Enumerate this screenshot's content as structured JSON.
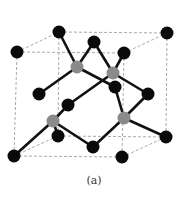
{
  "diagram": {
    "caption": "(a)",
    "colors": {
      "atom": "#0a0a0a",
      "interior_atom": "#8a8a8a",
      "bond": "#111111",
      "cube_edge": "#aaaaaa",
      "background": "#ffffff"
    },
    "atoms": [
      {
        "id": "a1",
        "x": 17,
        "y": 52,
        "type": "corner"
      },
      {
        "id": "a2",
        "x": 59,
        "y": 32,
        "type": "corner"
      },
      {
        "id": "a3",
        "x": 167,
        "y": 33,
        "type": "corner"
      },
      {
        "id": "a4",
        "x": 124,
        "y": 53,
        "type": "face"
      },
      {
        "id": "a5",
        "x": 94,
        "y": 42,
        "type": "face"
      },
      {
        "id": "a6",
        "x": 77,
        "y": 67,
        "type": "interior"
      },
      {
        "id": "a7",
        "x": 113,
        "y": 73,
        "type": "interior"
      },
      {
        "id": "a8",
        "x": 115,
        "y": 87,
        "type": "face"
      },
      {
        "id": "a9",
        "x": 148,
        "y": 94,
        "type": "face"
      },
      {
        "id": "a10",
        "x": 39,
        "y": 94,
        "type": "face"
      },
      {
        "id": "a11",
        "x": 68,
        "y": 105,
        "type": "face"
      },
      {
        "id": "a12",
        "x": 53,
        "y": 121,
        "type": "interior"
      },
      {
        "id": "a13",
        "x": 124,
        "y": 118,
        "type": "interior"
      },
      {
        "id": "a14",
        "x": 58,
        "y": 136,
        "type": "face"
      },
      {
        "id": "a15",
        "x": 166,
        "y": 137,
        "type": "corner"
      },
      {
        "id": "a16",
        "x": 14,
        "y": 156,
        "type": "corner"
      },
      {
        "id": "a17",
        "x": 93,
        "y": 147,
        "type": "face"
      },
      {
        "id": "a18",
        "x": 122,
        "y": 157,
        "type": "corner"
      }
    ],
    "bonds": [
      [
        "a6",
        "a2"
      ],
      [
        "a6",
        "a5"
      ],
      [
        "a6",
        "a10"
      ],
      [
        "a6",
        "a8"
      ],
      [
        "a7",
        "a5"
      ],
      [
        "a7",
        "a4"
      ],
      [
        "a7",
        "a9"
      ],
      [
        "a7",
        "a11"
      ],
      [
        "a12",
        "a11"
      ],
      [
        "a12",
        "a16"
      ],
      [
        "a12",
        "a14"
      ],
      [
        "a12",
        "a17"
      ],
      [
        "a13",
        "a8"
      ],
      [
        "a13",
        "a9"
      ],
      [
        "a13",
        "a15"
      ],
      [
        "a13",
        "a17"
      ]
    ],
    "cube_edges": [
      [
        17,
        52,
        124,
        53
      ],
      [
        59,
        32,
        167,
        33
      ],
      [
        17,
        52,
        59,
        32
      ],
      [
        124,
        53,
        167,
        33
      ],
      [
        14,
        156,
        122,
        157
      ],
      [
        58,
        136,
        166,
        137
      ],
      [
        14,
        156,
        58,
        136
      ],
      [
        122,
        157,
        166,
        137
      ],
      [
        17,
        52,
        14,
        156
      ],
      [
        124,
        53,
        122,
        157
      ],
      [
        59,
        32,
        58,
        136
      ],
      [
        167,
        33,
        166,
        137
      ]
    ]
  }
}
